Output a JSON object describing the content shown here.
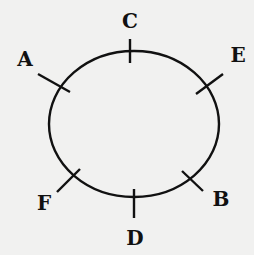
{
  "diagram": {
    "points": [
      {
        "id": "C",
        "label": "C",
        "position": "top"
      },
      {
        "id": "E",
        "label": "E",
        "position": "upper-right"
      },
      {
        "id": "B",
        "label": "B",
        "position": "lower-right"
      },
      {
        "id": "D",
        "label": "D",
        "position": "bottom"
      },
      {
        "id": "F",
        "label": "F",
        "position": "lower-left"
      },
      {
        "id": "A",
        "label": "A",
        "position": "upper-left"
      }
    ],
    "colors": {
      "ink": "#111111",
      "paper": "#f1f1f0"
    }
  }
}
